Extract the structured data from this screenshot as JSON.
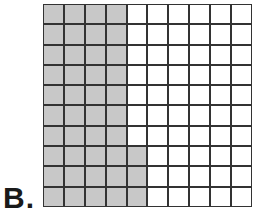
{
  "label": "B.",
  "grid": {
    "rows": 10,
    "columns": 10,
    "shaded_color": "#c8c8c8",
    "unshaded_color": "#ffffff",
    "line_color": "#333333",
    "shaded_per_row": [
      4,
      4,
      4,
      4,
      4,
      4,
      4,
      5,
      5,
      5
    ],
    "total_shaded": 43,
    "total_cells": 100
  }
}
